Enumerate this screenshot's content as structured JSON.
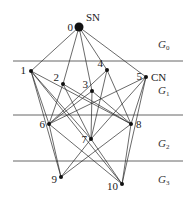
{
  "diagram": {
    "type": "layered-network-graph",
    "colors": {
      "edge": "#2a2a2a",
      "node": "#111111",
      "divider": "#555555",
      "background": "#ffffff"
    },
    "nodes": [
      {
        "id": "0",
        "label": "0",
        "x": 79,
        "y": 27,
        "r": 4.5,
        "tag": "SN"
      },
      {
        "id": "1",
        "label": "1",
        "x": 31,
        "y": 71,
        "r": 2
      },
      {
        "id": "2",
        "label": "2",
        "x": 63,
        "y": 84,
        "r": 2
      },
      {
        "id": "3",
        "label": "3",
        "x": 92,
        "y": 91,
        "r": 2
      },
      {
        "id": "4",
        "label": "4",
        "x": 107,
        "y": 70,
        "r": 2
      },
      {
        "id": "5",
        "label": "5",
        "x": 146,
        "y": 77,
        "r": 2,
        "tag": "CN"
      },
      {
        "id": "6",
        "label": "6",
        "x": 49,
        "y": 124,
        "r": 2
      },
      {
        "id": "7",
        "label": "7",
        "x": 91,
        "y": 139,
        "r": 2
      },
      {
        "id": "8",
        "label": "8",
        "x": 131,
        "y": 124,
        "r": 2
      },
      {
        "id": "9",
        "label": "9",
        "x": 61,
        "y": 177,
        "r": 2
      },
      {
        "id": "10",
        "label": "10",
        "x": 122,
        "y": 184,
        "r": 2
      }
    ],
    "edges": [
      [
        "0",
        "1"
      ],
      [
        "0",
        "2"
      ],
      [
        "0",
        "3"
      ],
      [
        "0",
        "4"
      ],
      [
        "0",
        "5"
      ],
      [
        "1",
        "6"
      ],
      [
        "1",
        "7"
      ],
      [
        "1",
        "8"
      ],
      [
        "1",
        "9"
      ],
      [
        "1",
        "10"
      ],
      [
        "2",
        "6"
      ],
      [
        "2",
        "7"
      ],
      [
        "2",
        "8"
      ],
      [
        "3",
        "6"
      ],
      [
        "3",
        "7"
      ],
      [
        "3",
        "8"
      ],
      [
        "4",
        "6"
      ],
      [
        "4",
        "7"
      ],
      [
        "4",
        "8"
      ],
      [
        "5",
        "6"
      ],
      [
        "5",
        "7"
      ],
      [
        "5",
        "8"
      ],
      [
        "5",
        "10"
      ],
      [
        "6",
        "9"
      ],
      [
        "6",
        "10"
      ],
      [
        "7",
        "9"
      ],
      [
        "7",
        "10"
      ],
      [
        "8",
        "9"
      ],
      [
        "8",
        "10"
      ]
    ],
    "dividers": [
      {
        "y": 61,
        "x1": 13,
        "x2": 183
      },
      {
        "y": 115,
        "x1": 13,
        "x2": 183
      },
      {
        "y": 161,
        "x1": 13,
        "x2": 183
      }
    ],
    "groups": [
      {
        "main": "G",
        "sub": "0",
        "x": 158,
        "y": 48
      },
      {
        "main": "G",
        "sub": "1",
        "x": 158,
        "y": 94
      },
      {
        "main": "G",
        "sub": "2",
        "x": 158,
        "y": 147
      },
      {
        "main": "G",
        "sub": "3",
        "x": 158,
        "y": 183
      }
    ],
    "tags": {
      "source": "SN",
      "control": "CN"
    }
  }
}
